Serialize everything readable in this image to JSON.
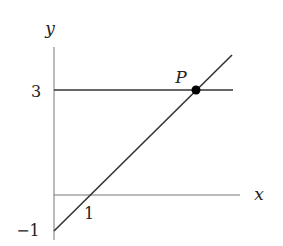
{
  "diagram": {
    "axes": {
      "x_label": "x",
      "y_label": "y",
      "x_tick_labels": [
        {
          "value": 1,
          "label": "1"
        }
      ],
      "y_tick_labels": [
        {
          "value": 3,
          "label": "3"
        },
        {
          "value": -1,
          "label": "−1"
        }
      ]
    },
    "lines": [
      {
        "name": "horizontal-line",
        "equation": "y = 3"
      },
      {
        "name": "slanted-line",
        "equation": "y = x - 1",
        "x_intercept": 1,
        "y_intercept": -1
      }
    ],
    "points": [
      {
        "name": "P",
        "label": "P",
        "x": 4,
        "y": 3
      }
    ],
    "colors": {
      "axes": "#777777",
      "lines": "#333333",
      "point": "#000000",
      "text": "#222222"
    }
  }
}
